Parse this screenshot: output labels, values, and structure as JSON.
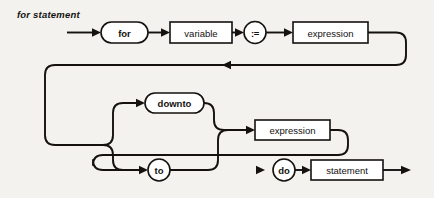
{
  "diagram": {
    "title": "for statement",
    "type": "syntax-railroad-diagram",
    "nodes": {
      "for_keyword": "for",
      "variable": "variable",
      "assign_operator": ":=",
      "expression_initial": "expression",
      "downto_keyword": "downto",
      "to_keyword": "to",
      "expression_final": "expression",
      "do_keyword": "do",
      "statement": "statement"
    },
    "sequence": [
      "for",
      "variable",
      ":=",
      "expression",
      "downto | to",
      "expression",
      "do",
      "statement"
    ],
    "branches": [
      "downto",
      "to"
    ]
  },
  "colors": {
    "background": "#f3f2ee",
    "ink": "#14110f",
    "node_fill": "#ffffff"
  }
}
